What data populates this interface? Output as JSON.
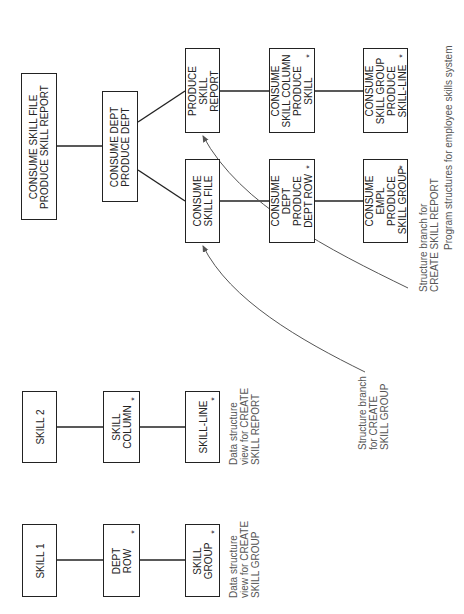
{
  "figure": {
    "title": "Program structures for employee skills system",
    "faint_caption": "Figure"
  },
  "program_structure": {
    "root": {
      "lines": [
        "CONSUME SKILL FILE",
        "PRODUCE SKILL REPORT"
      ]
    },
    "dept": {
      "lines": [
        "CONSUME DEPT",
        "PRODUCE DEPT"
      ]
    },
    "produce_report": {
      "lines": [
        "PRODUCE",
        "SKILL",
        "REPORT"
      ]
    },
    "consume_file": {
      "lines": [
        "CONSUME",
        "SKILL FILE"
      ]
    },
    "skill_column": {
      "lines": [
        "CONSUME",
        "SKILL COLUMN",
        "PRODUCE",
        "SKILL"
      ],
      "iteration": "*"
    },
    "dept_row": {
      "lines": [
        "CONSUME",
        "DEPT",
        "PRODUCE",
        "DEPT ROW"
      ],
      "iteration": "*"
    },
    "skill_group_line": {
      "lines": [
        "CONSUME",
        "SKILL GROUP",
        "PRODUCE",
        "SKILL-LINE"
      ],
      "iteration": "*"
    },
    "empl": {
      "lines": [
        "CONSUME",
        "EMPL",
        "PRODUCE",
        "SKILL GROUP"
      ],
      "iteration": "*"
    }
  },
  "data_structures": {
    "report_view": {
      "top": {
        "lines": [
          "SKILL 2"
        ]
      },
      "mid": {
        "lines": [
          "SKILL",
          "COLUMN"
        ],
        "iteration": "*"
      },
      "leaf": {
        "lines": [
          "SKILL-LINE"
        ],
        "iteration": "*"
      },
      "caption": [
        "Data structure",
        "view for CREATE",
        "SKILL REPORT"
      ]
    },
    "group_view": {
      "top": {
        "lines": [
          "SKILL 1"
        ]
      },
      "mid": {
        "lines": [
          "DEPT",
          "ROW"
        ],
        "iteration": "*"
      },
      "leaf": {
        "lines": [
          "SKILL",
          "GROUP"
        ],
        "iteration": "*"
      },
      "caption": [
        "Data structure",
        "view for CREATE",
        "SKILL GROUP"
      ]
    }
  },
  "annotations": {
    "branch_report": [
      "Structure branch for",
      "CREATE SKILL REPORT"
    ],
    "branch_group": [
      "Structure branch",
      "for CREATE",
      "SKILL GROUP"
    ]
  },
  "colors": {
    "line": "#222222",
    "arrow": "#555555",
    "caption_text": "#555555"
  }
}
